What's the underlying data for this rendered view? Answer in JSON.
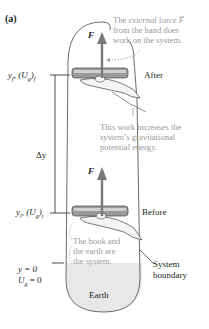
{
  "figure": {
    "label": "(a)",
    "colors": {
      "force_arrow": "#7a7a7a",
      "boundary": "#6d6d6d",
      "annotation_text": "#9a9a9a",
      "earth_fill": "#e6e6e6",
      "book": "#8d8d8d"
    }
  },
  "annotations": {
    "external_force_line1_pre": "The ",
    "external_force_line1_em": "external",
    "external_force_line1_post": " force ",
    "external_force_symbol": "F",
    "external_force_line2": "from the hand does",
    "external_force_line3": "work on the system.",
    "work_line1": "This work increases the",
    "work_line2": "system’s gravitational",
    "work_line3": "potential energy.",
    "system_line1": "The book and",
    "system_line2": "the earth are",
    "system_line3": "the system."
  },
  "states": {
    "after": {
      "label": "After",
      "force_symbol": "F"
    },
    "before": {
      "label": "Before",
      "force_symbol": "F"
    }
  },
  "axis": {
    "final_label": "yₑ, (Uₑ)ₑ",
    "final_y": "y",
    "final_y_sub": "f",
    "final_U": "U",
    "final_U_sub": "g",
    "final_U_post_sub": "f",
    "initial_y": "y",
    "initial_y_sub": "i",
    "initial_U": "U",
    "initial_U_sub": "g",
    "initial_U_post_sub": "i",
    "delta_label": "Δy",
    "zero_y": "y = 0",
    "zero_U": "U",
    "zero_U_sub": "g",
    "zero_U_post": " = 0"
  },
  "boundary": {
    "label_line1": "System",
    "label_line2": "boundary"
  },
  "earth": {
    "label": "Earth"
  }
}
